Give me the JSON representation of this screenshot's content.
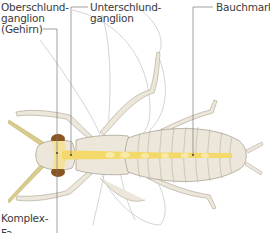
{
  "diagram": {
    "type": "anatomical illustration",
    "colors": {
      "body": "#ece7da",
      "body_outline": "#a9a394",
      "segment_lines": "#b7b0a0",
      "nerve_cord": "#f3d86a",
      "nerve_cord_light": "#f8eaa6",
      "compound_eye": "#8a5520",
      "antenna": "#d9cc8a",
      "leader_line": "#7a7a7a",
      "wing_outline": "#b9b9b9",
      "label_text": "#3a3a3a"
    }
  },
  "labels": {
    "oberschlund": {
      "line1": "Oberschlund-",
      "line2": "ganglion",
      "line3": "(Gehirn)"
    },
    "unterschlund": {
      "line1": "Unterschlund-",
      "line2": "ganglion"
    },
    "bauchmark": "Bauchmark",
    "komplexauge": "Komplex-",
    "cut_off_text": "Fa..."
  }
}
